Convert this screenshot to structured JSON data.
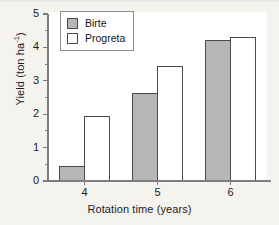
{
  "chart_data": {
    "type": "bar",
    "title": "",
    "subtitle": "",
    "xlabel": "Rotation time (years)",
    "ylabel": "Yield (ton ha-1)",
    "ylabel_base": "Yield (ton ha",
    "ylabel_sup": "-1",
    "ylabel_tail": ")",
    "categories": [
      "4",
      "5",
      "6"
    ],
    "series": [
      {
        "name": "Birte",
        "values": [
          0.42,
          2.63,
          4.2
        ],
        "color": "#b6b6b6",
        "edge": "#4a4a4a"
      },
      {
        "name": "Progreta",
        "values": [
          1.92,
          3.44,
          4.3
        ],
        "color": "#ffffff",
        "edge": "#4a4a4a"
      }
    ],
    "ylim": [
      0,
      5
    ],
    "yticks": [
      0,
      1,
      2,
      3,
      4,
      5
    ],
    "ytick_labels": [
      "0",
      "1",
      "2",
      "3",
      "4",
      "5"
    ],
    "yminor_step": 0.5,
    "grid": false,
    "legend_position": "upper left",
    "axis_color": "#7d7d7d",
    "background": "#f5f3ee",
    "plot_background": "#ffffff"
  },
  "legend": {
    "entries": [
      {
        "label": "Birte"
      },
      {
        "label": "Progreta"
      }
    ]
  },
  "axes": {
    "y_label_text": "Yield (ton ha",
    "y_label_sup": "-1",
    "y_label_close": ")",
    "x_label_text": "Rotation time (years)"
  }
}
